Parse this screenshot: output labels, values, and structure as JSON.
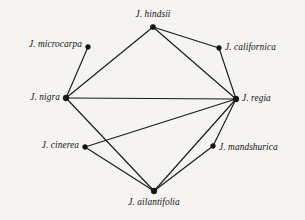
{
  "diagram": {
    "type": "undirected-graph",
    "background_color": "#f6f4f1",
    "line_color": "#1a1a1a",
    "node_color": "#141414",
    "width": 305,
    "height": 220,
    "nodes": [
      {
        "id": "hindsii",
        "label": "J. hindsii",
        "x": 153,
        "y": 27,
        "label_x": 153,
        "label_y": 15,
        "anchor": "center",
        "dot_r": 2.6
      },
      {
        "id": "microcarpa",
        "label": "J. microcarpa",
        "x": 88,
        "y": 47,
        "label_x": 82,
        "label_y": 45,
        "anchor": "left",
        "dot_r": 2.4
      },
      {
        "id": "californica",
        "label": "J. californica",
        "x": 219,
        "y": 48,
        "label_x": 225,
        "label_y": 48,
        "anchor": "right",
        "dot_r": 2.4
      },
      {
        "id": "nigra",
        "label": "J. nigra",
        "x": 66,
        "y": 98,
        "label_x": 60,
        "label_y": 98,
        "anchor": "left",
        "dot_r": 2.9
      },
      {
        "id": "regia",
        "label": "J. regia",
        "x": 236,
        "y": 99,
        "label_x": 242,
        "label_y": 99,
        "anchor": "right",
        "dot_r": 2.9
      },
      {
        "id": "cinerea",
        "label": "J. cinerea",
        "x": 85,
        "y": 147,
        "label_x": 79,
        "label_y": 146,
        "anchor": "left",
        "dot_r": 2.4
      },
      {
        "id": "mandshurica",
        "label": "J. mandshurica",
        "x": 213,
        "y": 146,
        "label_x": 219,
        "label_y": 148,
        "anchor": "right",
        "dot_r": 2.4
      },
      {
        "id": "ailantifolia",
        "label": "J. ailantifolia",
        "x": 154,
        "y": 191,
        "label_x": 154,
        "label_y": 203,
        "anchor": "center",
        "dot_r": 2.9
      }
    ],
    "edges": [
      {
        "source": "nigra",
        "target": "microcarpa"
      },
      {
        "source": "nigra",
        "target": "hindsii"
      },
      {
        "source": "nigra",
        "target": "regia"
      },
      {
        "source": "nigra",
        "target": "ailantifolia"
      },
      {
        "source": "hindsii",
        "target": "californica"
      },
      {
        "source": "hindsii",
        "target": "regia"
      },
      {
        "source": "californica",
        "target": "regia"
      },
      {
        "source": "cinerea",
        "target": "regia"
      },
      {
        "source": "cinerea",
        "target": "ailantifolia"
      },
      {
        "source": "ailantifolia",
        "target": "regia"
      },
      {
        "source": "ailantifolia",
        "target": "mandshurica"
      },
      {
        "source": "mandshurica",
        "target": "regia"
      }
    ]
  }
}
